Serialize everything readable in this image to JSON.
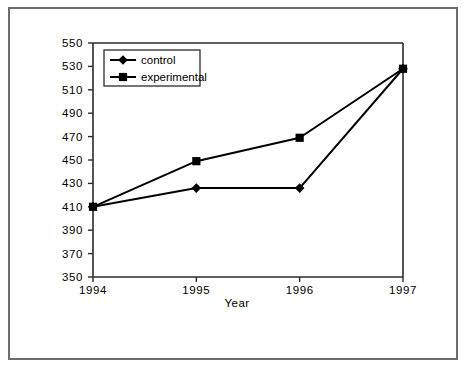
{
  "figure": {
    "outer_border": true,
    "background": "#ffffff",
    "line_color": "#000000",
    "axis_color": "#2b2b2b",
    "border_color": "#6d6d6d"
  },
  "legend": {
    "position": "top-left-inside",
    "entries": [
      {
        "label": "control",
        "marker": "diamond"
      },
      {
        "label": "experimental",
        "marker": "square"
      }
    ]
  },
  "chart_data": {
    "type": "line",
    "title": "",
    "xlabel": "Year",
    "ylabel": "",
    "categories": [
      "1994",
      "1995",
      "1996",
      "1997"
    ],
    "x": [
      1994,
      1995,
      1996,
      1997
    ],
    "xlim": [
      1994,
      1997
    ],
    "ylim": [
      350,
      550
    ],
    "ytick_step": 20,
    "yticks": [
      350,
      370,
      390,
      410,
      430,
      450,
      470,
      490,
      510,
      530,
      550
    ],
    "xticks": [
      "1994",
      "1995",
      "1996",
      "1997"
    ],
    "grid": false,
    "legend_position": "upper left",
    "series": [
      {
        "name": "control",
        "marker": "diamond",
        "values": [
          410,
          426,
          426,
          528
        ]
      },
      {
        "name": "experimental",
        "marker": "square",
        "values": [
          410,
          449,
          469,
          528
        ]
      }
    ]
  }
}
